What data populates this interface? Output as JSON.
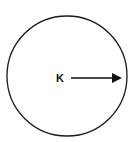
{
  "diagram": {
    "center_label": "K",
    "circle": {
      "cx": 67,
      "cy": 76,
      "r": 60,
      "stroke": "#1a1a1a"
    },
    "arrow": {
      "x1": 71,
      "y1": 78,
      "x2": 121,
      "y2": 78,
      "color": "#111111",
      "meaning": "radius"
    }
  }
}
